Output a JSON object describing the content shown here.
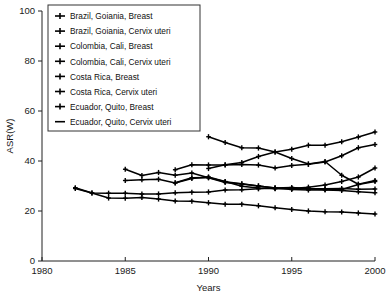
{
  "chart_data": {
    "type": "line",
    "title": "",
    "xlabel": "Years",
    "ylabel": "ASR(W)",
    "xlim": [
      1980,
      2000
    ],
    "ylim": [
      0,
      100
    ],
    "xticks": [
      1980,
      1985,
      1990,
      1995,
      2000
    ],
    "yticks": [
      0,
      20,
      40,
      60,
      80,
      100
    ],
    "grid": false,
    "legend_position": "upper-left",
    "series": [
      {
        "name": "Brazil, Goiania, Breast",
        "x": [
          1988,
          1989,
          1990,
          1991,
          1992,
          1993,
          1994,
          1995,
          1996,
          1997,
          1998,
          1999,
          2000
        ],
        "values": [
          36.5,
          38.5,
          38.4,
          38.4,
          38.6,
          38.4,
          37.2,
          38.2,
          38.7,
          39.6,
          42.1,
          45.3,
          46.6
        ]
      },
      {
        "name": "Brazil, Goiania, Cervix uteri",
        "x": [
          1988,
          1989,
          1990,
          1991,
          1992,
          1993,
          1994,
          1995,
          1996,
          1997,
          1998,
          1999,
          2000
        ],
        "values": [
          31.3,
          33.3,
          33.4,
          31.7,
          30.9,
          30.0,
          29.2,
          29.0,
          28.8,
          28.6,
          28.6,
          30.6,
          31.8
        ]
      },
      {
        "name": "Colombia, Cali, Breast",
        "x": [
          1985,
          1986,
          1987,
          1988,
          1989,
          1990,
          1991,
          1992,
          1993,
          1994,
          1995,
          1996,
          1997,
          1998,
          1999,
          2000
        ],
        "values": [
          32.2,
          32.5,
          32.7,
          31.2,
          33.0,
          33.6,
          31.8,
          29.9,
          29.2,
          28.9,
          29.0,
          29.5,
          30.4,
          31.8,
          33.6,
          37.2
        ]
      },
      {
        "name": "Colombia, Cali, Cervix uteri",
        "x": [
          1985,
          1986,
          1987,
          1988,
          1989,
          1990,
          1991,
          1992,
          1993,
          1994,
          1995,
          1996,
          1997,
          1998,
          1999,
          2000
        ],
        "values": [
          36.7,
          34.2,
          35.4,
          34.3,
          35.2,
          33.3,
          31.4,
          30.8,
          30.0,
          29.2,
          28.6,
          28.4,
          28.4,
          28.2,
          27.7,
          27.3
        ]
      },
      {
        "name": "Costa Rica, Breast",
        "x": [
          1990,
          1991,
          1992,
          1993,
          1994,
          1995,
          1996,
          1997,
          1998,
          1999,
          2000
        ],
        "values": [
          37.0,
          38.5,
          39.4,
          41.8,
          43.6,
          44.7,
          46.3,
          46.3,
          47.7,
          49.6,
          51.6
        ]
      },
      {
        "name": "Costa Rica, Cervix uteri",
        "x": [
          1990,
          1991,
          1992,
          1993,
          1994,
          1995,
          1996,
          1997,
          1998,
          1999,
          2000
        ],
        "values": [
          49.7,
          47.4,
          45.3,
          45.2,
          43.6,
          41.0,
          38.8,
          39.8,
          34.3,
          30.7,
          32.2
        ]
      },
      {
        "name": "Ecuador, Quito, Breast",
        "x": [
          1982,
          1983,
          1984,
          1985,
          1986,
          1987,
          1988,
          1989,
          1990,
          1991,
          1992,
          1993,
          1994,
          1995,
          1996,
          1997,
          1998,
          1999,
          2000
        ],
        "values": [
          29.3,
          27.2,
          27.1,
          27.1,
          26.8,
          26.8,
          27.3,
          27.5,
          27.6,
          28.4,
          28.5,
          28.9,
          29.2,
          29.4,
          29.0,
          28.9,
          29.0,
          28.7,
          28.8
        ]
      },
      {
        "name": "Ecuador, Quito, Cervix uteri",
        "x": [
          1982,
          1983,
          1984,
          1985,
          1986,
          1987,
          1988,
          1989,
          1990,
          1991,
          1992,
          1993,
          1994,
          1995,
          1996,
          1997,
          1998,
          1999,
          2000
        ],
        "values": [
          29.0,
          27.2,
          25.2,
          25.1,
          25.4,
          24.8,
          24.0,
          23.9,
          23.3,
          22.7,
          22.7,
          22.1,
          21.3,
          20.6,
          20.0,
          19.7,
          19.6,
          19.2,
          18.8
        ]
      }
    ]
  },
  "axes": {
    "ylabel": "ASR(W)",
    "xlabel": "Years",
    "xtick_labels": [
      "1980",
      "1985",
      "1990",
      "1995",
      "2000"
    ],
    "ytick_labels": [
      "0",
      "20",
      "40",
      "60",
      "80",
      "100"
    ]
  },
  "legend": {
    "items": [
      {
        "label": "Brazil, Goiania, Breast",
        "marker": "plus-marker"
      },
      {
        "label": "Brazil, Goiania, Cervix uteri",
        "marker": "plus-marker"
      },
      {
        "label": "Colombia, Cali, Breast",
        "marker": "plus-marker"
      },
      {
        "label": "Colombia, Cali, Cervix uteri",
        "marker": "plus-marker"
      },
      {
        "label": "Costa Rica, Breast",
        "marker": "plus-marker"
      },
      {
        "label": "Costa Rica, Cervix uteri",
        "marker": "plus-marker"
      },
      {
        "label": "Ecuador, Quito, Breast",
        "marker": "plus-marker"
      },
      {
        "label": "Ecuador, Quito, Cervix uteri",
        "marker": "line-marker"
      }
    ]
  },
  "colors": {
    "series": "#000000",
    "axis": "#202020",
    "text": "#111111",
    "background": "#ffffff"
  }
}
